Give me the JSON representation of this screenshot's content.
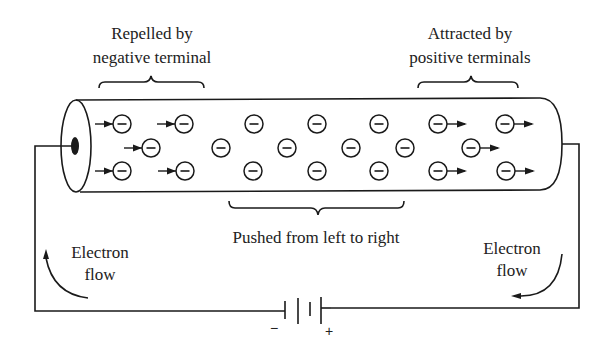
{
  "diagram": {
    "labels": {
      "top_left_line1": "Repelled by",
      "top_left_line2": "negative terminal",
      "top_right_line1": "Attracted by",
      "top_right_line2": "positive terminals",
      "bottom_center": "Pushed from left to right",
      "left_flow_line1": "Electron",
      "left_flow_line2": "flow",
      "right_flow_line1": "Electron",
      "right_flow_line2": "flow"
    },
    "battery": {
      "negative_sign": "−",
      "positive_sign": "+"
    },
    "electron_symbol": "−",
    "colors": {
      "ink": "#1a1a1a",
      "background": "#ffffff"
    },
    "electrons": [
      {
        "x": 122,
        "y": 124,
        "arrow": "left"
      },
      {
        "x": 184,
        "y": 124,
        "arrow": "left"
      },
      {
        "x": 254,
        "y": 124,
        "arrow": "none"
      },
      {
        "x": 317,
        "y": 124,
        "arrow": "none"
      },
      {
        "x": 379,
        "y": 124,
        "arrow": "none"
      },
      {
        "x": 438,
        "y": 124,
        "arrow": "right"
      },
      {
        "x": 505,
        "y": 124,
        "arrow": "right"
      },
      {
        "x": 151,
        "y": 148,
        "arrow": "left"
      },
      {
        "x": 221,
        "y": 148,
        "arrow": "none"
      },
      {
        "x": 287,
        "y": 148,
        "arrow": "none"
      },
      {
        "x": 351,
        "y": 148,
        "arrow": "none"
      },
      {
        "x": 405,
        "y": 148,
        "arrow": "none"
      },
      {
        "x": 471,
        "y": 148,
        "arrow": "right"
      },
      {
        "x": 122,
        "y": 171,
        "arrow": "left"
      },
      {
        "x": 185,
        "y": 171,
        "arrow": "left"
      },
      {
        "x": 253,
        "y": 171,
        "arrow": "none"
      },
      {
        "x": 317,
        "y": 171,
        "arrow": "none"
      },
      {
        "x": 379,
        "y": 171,
        "arrow": "none"
      },
      {
        "x": 438,
        "y": 171,
        "arrow": "right"
      },
      {
        "x": 506,
        "y": 171,
        "arrow": "right"
      }
    ]
  }
}
